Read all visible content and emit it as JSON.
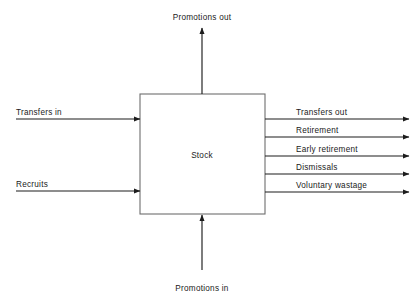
{
  "diagram": {
    "title_text": "Stock and flow diagram of manpower movements",
    "stock": {
      "label": "Stock",
      "x": 140,
      "y": 94,
      "width": 125,
      "height": 120,
      "border_color": "#6e6e6e"
    },
    "line_color": "#1c1c1c",
    "background_color": "#ffffff",
    "inflows_left": [
      {
        "label": "Transfers in",
        "y": 119,
        "start_x": 16,
        "label_x": 16
      },
      {
        "label": "Recruits",
        "y": 191,
        "start_x": 16,
        "label_x": 16
      }
    ],
    "inflow_bottom": {
      "label": "Promotions in",
      "x": 202,
      "line_start_y": 270,
      "line_end_y": 215,
      "label_y": 291
    },
    "outflow_top": {
      "label": "Promotions out",
      "x": 202,
      "line_start_y": 94,
      "line_end_y": 28,
      "label_y": 20
    },
    "outflows_right": [
      {
        "label": "Transfers out",
        "y": 119,
        "end_x": 409,
        "label_x": 296
      },
      {
        "label": "Retirement",
        "y": 137,
        "end_x": 409,
        "label_x": 296
      },
      {
        "label": "Early retirement",
        "y": 156,
        "end_x": 409,
        "label_x": 296
      },
      {
        "label": "Dismissals",
        "y": 174,
        "end_x": 409,
        "label_x": 296
      },
      {
        "label": "Voluntary wastage",
        "y": 192,
        "end_x": 409,
        "label_x": 296
      }
    ]
  }
}
